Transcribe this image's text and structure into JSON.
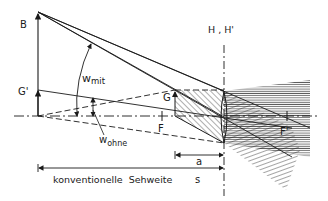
{
  "diagram": {
    "labels": {
      "B": "B",
      "G_prime": "G'",
      "G": "G",
      "H_H_prime": "H , H'",
      "F": "F",
      "F_prime": "F'",
      "w_mit_main": "w",
      "w_mit_sub": "mit",
      "w_ohne_main": "w",
      "w_ohne_sub": "ohne",
      "a": "a",
      "s": "s",
      "bottom_caption": "konventionelle  Sehweite"
    },
    "colors": {
      "ink": "#1a1a1a",
      "background": "#ffffff"
    }
  }
}
